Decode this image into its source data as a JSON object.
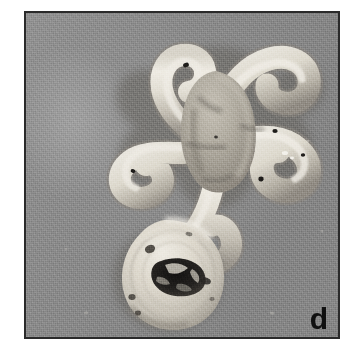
{
  "figure": {
    "panel_letter": "d",
    "caption_visible": "",
    "modality": "grayscale photograph",
    "frame": {
      "border_color": "#2a2a2a",
      "page_background": "#ffffff",
      "plate_background": "#8a8a8a",
      "left": 24,
      "top": 11,
      "width": 316,
      "height": 328
    },
    "colors": {
      "background_gray": "#8a8a8a",
      "background_gray_light": "#9a9a9a",
      "background_gray_dark": "#7c7c7c",
      "specimen_highlight": "#e8e5de",
      "specimen_midtone": "#cfcabf",
      "specimen_shadow": "#7a766e",
      "cavity_dark": "#1c1a18",
      "label_color": "#101010"
    },
    "specimens": [
      {
        "name": "stellate-specimen",
        "description": "pale five-armed star-shaped specimen with thick wavy serpentine arms and a broad central body",
        "arm_count": 5,
        "position": "upper portion of frame",
        "center_x": 186,
        "center_y": 110,
        "approx_width": 175,
        "approx_height": 195
      },
      {
        "name": "disc-specimen",
        "description": "pale circular disc-shaped specimen with an irregular dark central cavity and small dark pits near the rim",
        "position": "lower-left of centre",
        "center_x": 164,
        "center_y": 270,
        "approx_diameter": 105
      }
    ]
  }
}
